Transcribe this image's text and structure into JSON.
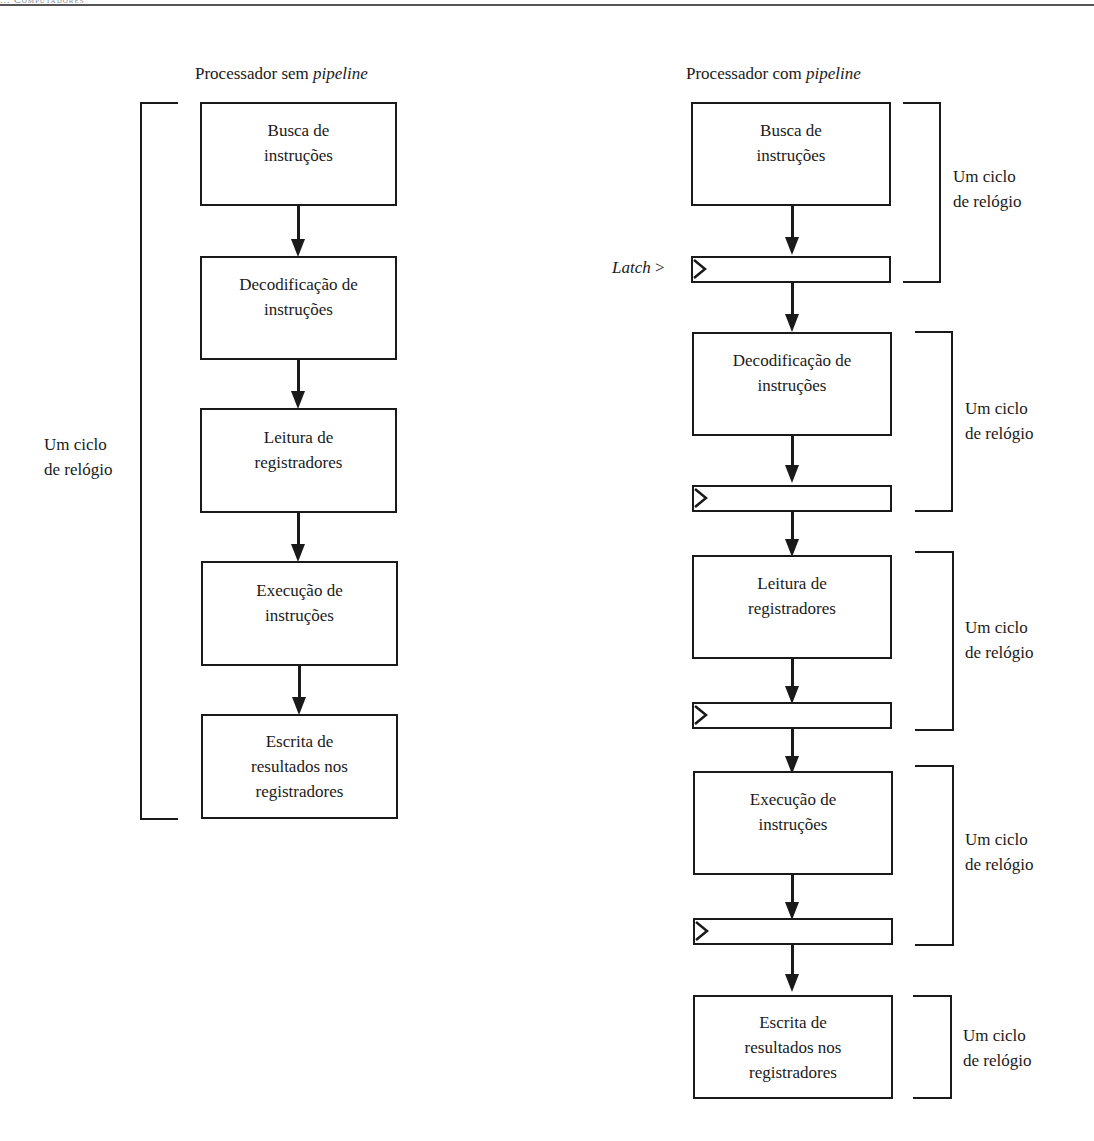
{
  "page": {
    "running_head": "... Computadores"
  },
  "left_diagram": {
    "title_prefix": "Processador sem ",
    "title_italic": "pipeline",
    "clock_label": "Um ciclo\nde relógio",
    "stages": [
      {
        "label": "Busca de\ninstruções"
      },
      {
        "label": "Decodificação de\ninstruções"
      },
      {
        "label": "Leitura de\nregistradores"
      },
      {
        "label": "Execução de\ninstruções"
      },
      {
        "label": "Escrita de\nresultados nos\nregistradores"
      }
    ]
  },
  "right_diagram": {
    "title_prefix": "Processador com ",
    "title_italic": "pipeline",
    "latch_label_italic": "Latch",
    "latch_label_suffix": " >",
    "stages": [
      {
        "label": "Busca de\ninstruções",
        "clock_label": "Um ciclo\nde relógio"
      },
      {
        "label": "Decodificação de\ninstruções",
        "clock_label": "Um ciclo\nde relógio"
      },
      {
        "label": "Leitura de\nregistradores",
        "clock_label": "Um ciclo\nde relógio"
      },
      {
        "label": "Execução de\ninstruções",
        "clock_label": "Um ciclo\nde relógio"
      },
      {
        "label": "Escrita de\nresultados nos\nregistradores",
        "clock_label": "Um ciclo\nde relógio"
      }
    ]
  }
}
